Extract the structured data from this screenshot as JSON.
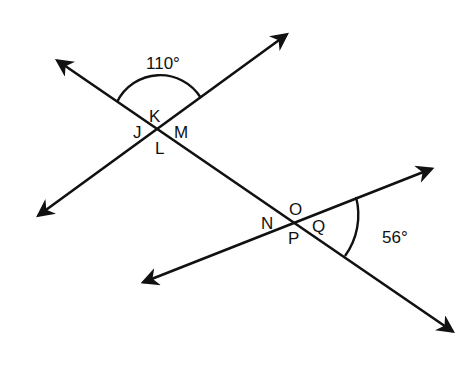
{
  "diagram": {
    "lines": [
      {
        "name": "transversal",
        "from": [
          54,
          58
        ],
        "to": [
          456,
          334
        ]
      },
      {
        "name": "line-1",
        "from": [
          35,
          218
        ],
        "to": [
          290,
          32
        ]
      },
      {
        "name": "line-2",
        "from": [
          140,
          284
        ],
        "to": [
          435,
          167
        ]
      }
    ],
    "intersections": [
      {
        "name": "upper",
        "at": [
          157,
          130
        ],
        "labels": {
          "top": "K",
          "left": "J",
          "right": "M",
          "bottom": "L"
        }
      },
      {
        "name": "lower",
        "at": [
          292,
          222
        ],
        "labels": {
          "top": "O",
          "left": "N",
          "right": "Q",
          "bottom": "P"
        }
      }
    ],
    "angles": [
      {
        "name": "upper-angle",
        "value": "110°"
      },
      {
        "name": "lower-angle",
        "value": "56°"
      }
    ]
  }
}
